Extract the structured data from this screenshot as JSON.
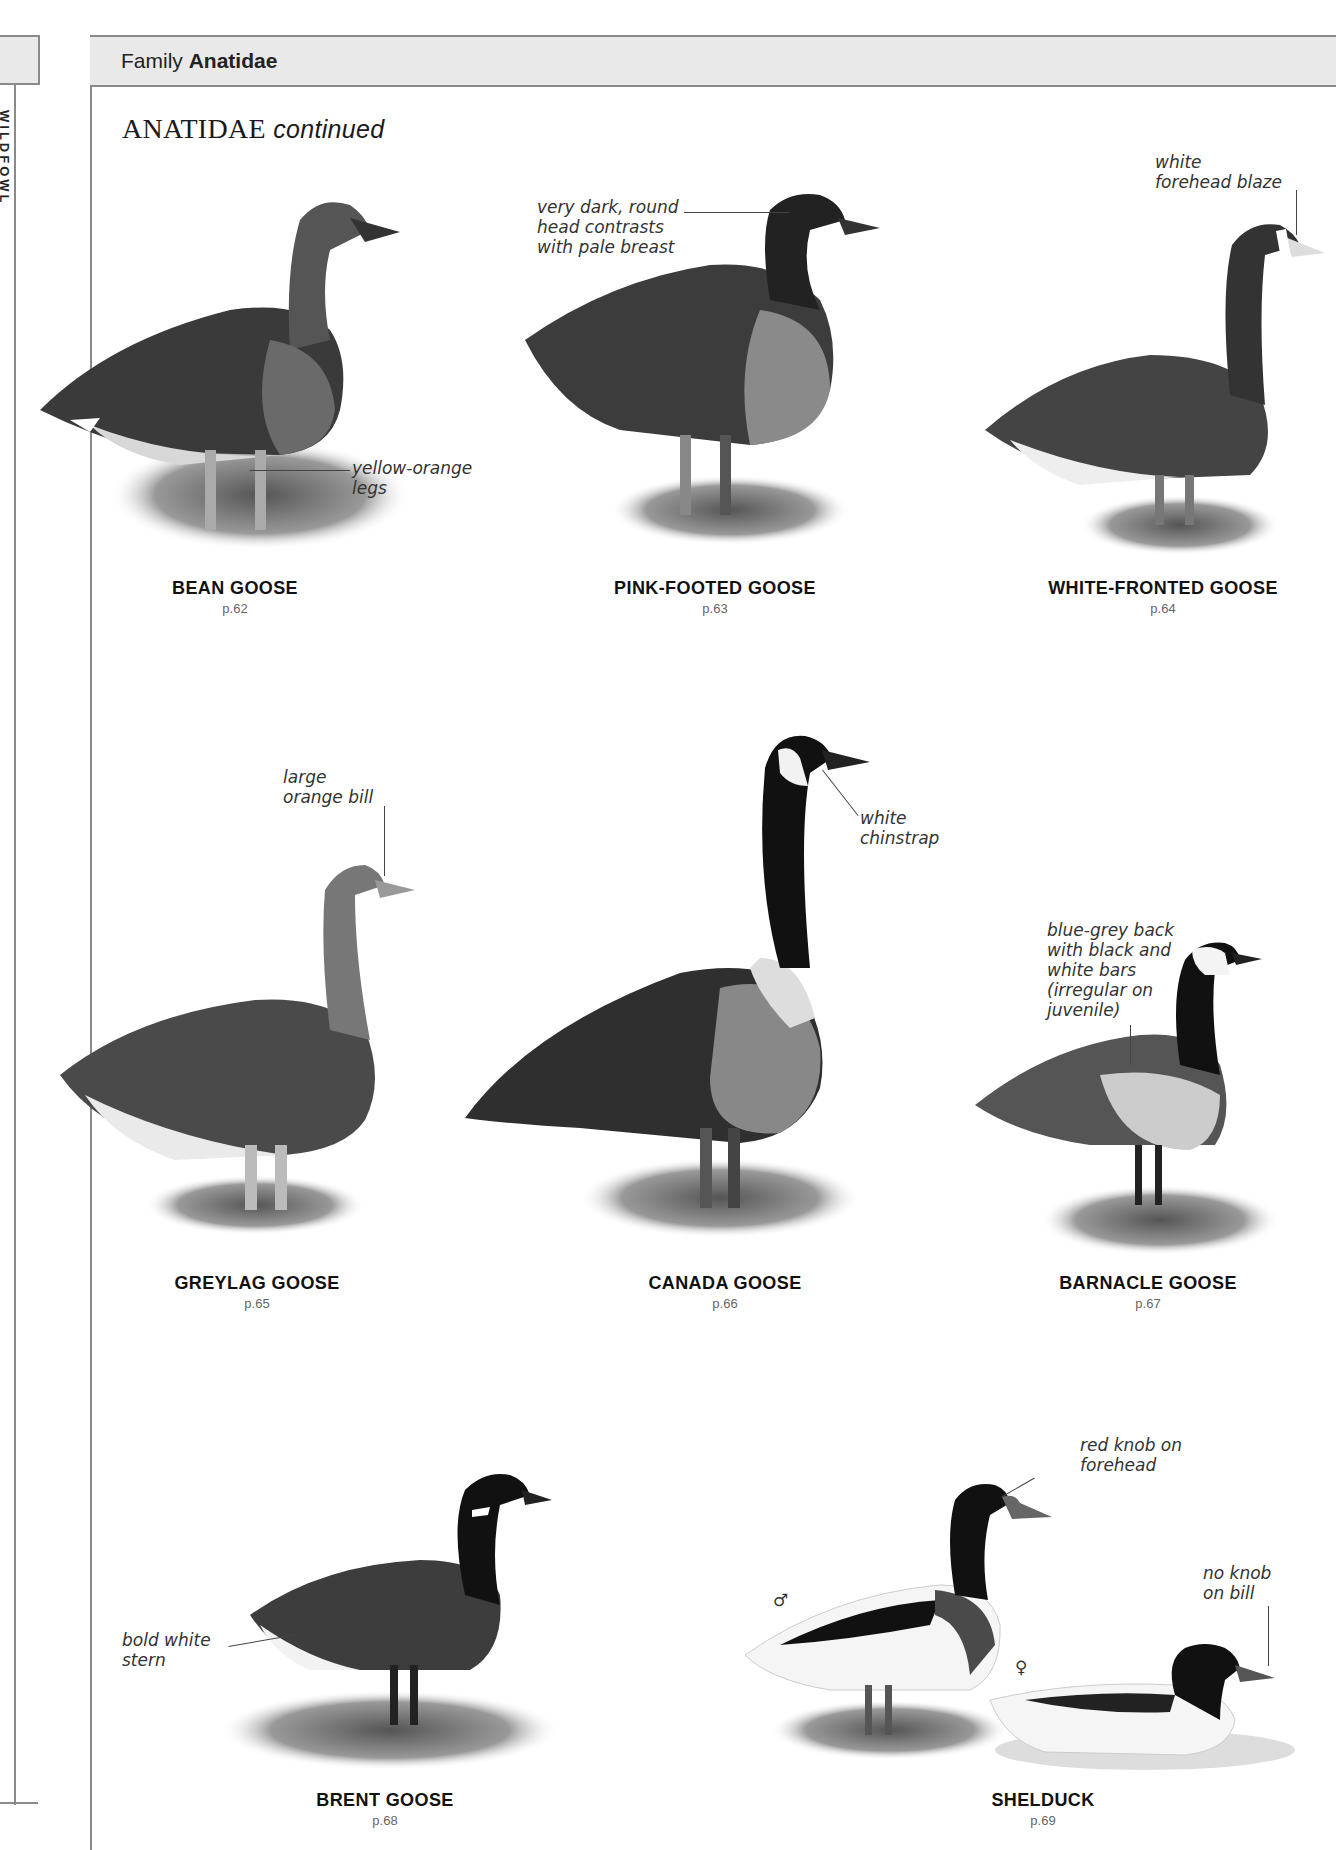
{
  "previous_page": {
    "vertical_label": "WILDFOWL"
  },
  "header": {
    "family_prefix": "Family",
    "family_name": "Anatidae"
  },
  "section": {
    "title": "ANATIDAE",
    "title_suffix": "continued"
  },
  "species": [
    {
      "name": "BEAN GOOSE",
      "page": "p.62"
    },
    {
      "name": "PINK-FOOTED GOOSE",
      "page": "p.63"
    },
    {
      "name": "WHITE-FRONTED GOOSE",
      "page": "p.64"
    },
    {
      "name": "GREYLAG GOOSE",
      "page": "p.65"
    },
    {
      "name": "CANADA GOOSE",
      "page": "p.66"
    },
    {
      "name": "BARNACLE GOOSE",
      "page": "p.67"
    },
    {
      "name": "BRENT GOOSE",
      "page": "p.68"
    },
    {
      "name": "SHELDUCK",
      "page": "p.69"
    }
  ],
  "annotations": {
    "bean_legs": "yellow-orange\nlegs",
    "pinkfoot_head": "very dark, round\nhead contrasts\nwith pale breast",
    "whitefront_blaze": "white\nforehead blaze",
    "greylag_bill": "large\norange bill",
    "canada_chinstrap": "white\nchinstrap",
    "barnacle_back": "blue-grey back\nwith black and\nwhite bars\n(irregular on\njuvenile)",
    "brent_stern": "bold white\nstern",
    "shelduck_male_knob": "red knob on\nforehead",
    "shelduck_female_bill": "no knob\non bill"
  },
  "symbols": {
    "male": "♂",
    "female": "♀"
  },
  "colors": {
    "header_bg": "#e9e9e9",
    "rule": "#8a8a8a",
    "caption_page": "#666666"
  }
}
